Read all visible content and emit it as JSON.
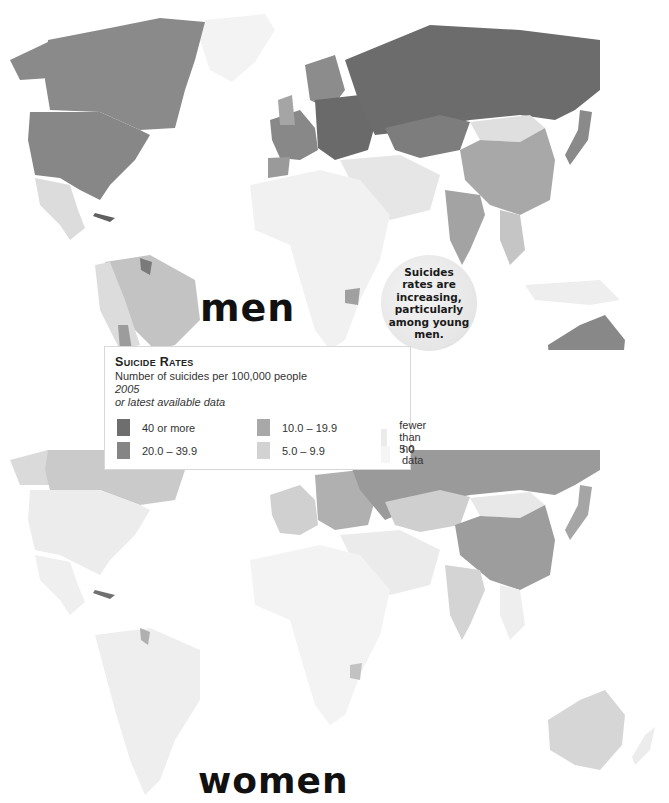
{
  "panels": {
    "men": {
      "label": "men"
    },
    "women": {
      "label": "women"
    }
  },
  "callout": {
    "text": "Suicides rates are increasing, particularly among young men."
  },
  "legend": {
    "title": "Suicide Rates",
    "subtitle": "Number of suicides per 100,000 people",
    "year": "2005",
    "note": "or latest available data",
    "items": [
      {
        "label": "40 or more",
        "color": "#6e6e6e"
      },
      {
        "label": "20.0 – 39.9",
        "color": "#858585"
      },
      {
        "label": "10.0 – 19.9",
        "color": "#a8a8a8"
      },
      {
        "label": "5.0 – 9.9",
        "color": "#d2d2d2"
      },
      {
        "label": "fewer than 5.0",
        "color": "#ebebeb"
      },
      {
        "label": "no data",
        "color": "#f5f5f5"
      }
    ]
  },
  "map_data": {
    "title": "Suicide Rates",
    "unit": "suicides per 100,000 people",
    "year": "2005 or latest available data",
    "men": {
      "Russia": "40 or more",
      "Eastern Europe / Baltics": "40 or more",
      "Kazakhstan": "20.0 – 39.9",
      "Canada": "20.0 – 39.9",
      "United States": "20.0 – 39.9",
      "Western Europe": "20.0 – 39.9",
      "Australia": "20.0 – 39.9",
      "Japan": "20.0 – 39.9",
      "Guyana": "20.0 – 39.9",
      "Uruguay": "20.0 – 39.9",
      "Chile": "10.0 – 19.9",
      "China": "10.0 – 19.9",
      "India": "10.0 – 19.9",
      "Zimbabwe": "10.0 – 19.9",
      "Brazil": "5.0 – 9.9",
      "Mexico": "5.0 – 9.9",
      "Mongolia": "5.0 – 9.9",
      "Africa (most)": "no data"
    },
    "women": {
      "Russia": "10.0 – 19.9",
      "China": "10.0 – 19.9",
      "Japan": "10.0 – 19.9",
      "Canada": "5.0 – 9.9",
      "Kazakhstan": "5.0 – 9.9",
      "Australia": "5.0 – 9.9",
      "India": "5.0 – 9.9",
      "Zimbabwe": "5.0 – 9.9",
      "United States": "fewer than 5.0",
      "South America (most)": "fewer than 5.0",
      "Mexico": "fewer than 5.0",
      "Africa (most)": "no data"
    }
  }
}
